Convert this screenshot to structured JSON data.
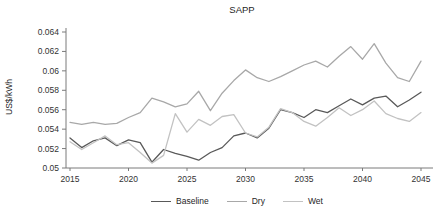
{
  "chart_data": {
    "type": "line",
    "title": "SAPP",
    "ylabel": "US$/kWh",
    "xlabel": "",
    "grid": false,
    "legend_position": "bottom",
    "xlim": [
      2015,
      2045
    ],
    "ylim": [
      0.05,
      0.064
    ],
    "xtick_labels": [
      "2015",
      "2020",
      "2025",
      "2030",
      "2035",
      "2040",
      "2045"
    ],
    "xtick_values": [
      2015,
      2020,
      2025,
      2030,
      2035,
      2040,
      2045
    ],
    "ytick_labels": [
      "0.05",
      "0.052",
      "0.054",
      "0.056",
      "0.058",
      "0.06",
      "0.062",
      "0.064"
    ],
    "x": [
      2015,
      2016,
      2017,
      2018,
      2019,
      2020,
      2021,
      2022,
      2023,
      2024,
      2025,
      2026,
      2027,
      2028,
      2029,
      2030,
      2031,
      2032,
      2033,
      2034,
      2035,
      2036,
      2037,
      2038,
      2039,
      2040,
      2041,
      2042,
      2043,
      2044,
      2045
    ],
    "series": [
      {
        "name": "Baseline",
        "color": "#595959",
        "values": [
          0.0531,
          0.0521,
          0.0528,
          0.0531,
          0.0523,
          0.0529,
          0.0526,
          0.0506,
          0.0519,
          0.0515,
          0.0512,
          0.0508,
          0.0516,
          0.0521,
          0.0533,
          0.0536,
          0.0531,
          0.0541,
          0.056,
          0.0557,
          0.0552,
          0.056,
          0.0557,
          0.0564,
          0.0571,
          0.0565,
          0.0572,
          0.0574,
          0.0563,
          0.057,
          0.0578
        ]
      },
      {
        "name": "Dry",
        "color": "#a8a8a8",
        "values": [
          0.0547,
          0.0545,
          0.0547,
          0.0545,
          0.0546,
          0.0552,
          0.0557,
          0.0572,
          0.0568,
          0.0563,
          0.0566,
          0.0579,
          0.0559,
          0.0577,
          0.059,
          0.0601,
          0.0593,
          0.0589,
          0.0594,
          0.06,
          0.0606,
          0.061,
          0.0604,
          0.0615,
          0.0625,
          0.0612,
          0.0628,
          0.0608,
          0.0593,
          0.0589,
          0.061
        ]
      },
      {
        "name": "Wet",
        "color": "#c2c2c2",
        "values": [
          0.0527,
          0.0519,
          0.0526,
          0.0533,
          0.0524,
          0.0526,
          0.0516,
          0.0505,
          0.0513,
          0.0556,
          0.0537,
          0.055,
          0.0544,
          0.0553,
          0.0555,
          0.0536,
          0.0532,
          0.0542,
          0.0561,
          0.0557,
          0.0548,
          0.0543,
          0.0552,
          0.0562,
          0.0554,
          0.056,
          0.0569,
          0.0556,
          0.0551,
          0.0548,
          0.0557
        ]
      }
    ]
  }
}
